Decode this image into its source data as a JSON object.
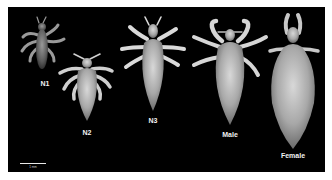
{
  "figure": {
    "background": "#000000",
    "specimens": [
      {
        "id": "n1",
        "label": "N1",
        "label_x": 37,
        "label_y": 73
      },
      {
        "id": "n2",
        "label": "N2",
        "label_x": 79,
        "label_y": 122
      },
      {
        "id": "n3",
        "label": "N3",
        "label_x": 145,
        "label_y": 110
      },
      {
        "id": "male",
        "label": "Male",
        "label_x": 222,
        "label_y": 124
      },
      {
        "id": "female",
        "label": "Female",
        "label_x": 285,
        "label_y": 145
      }
    ],
    "scale_bar": {
      "label": "1 mm",
      "x": 12,
      "y": 156,
      "width": 26
    }
  }
}
